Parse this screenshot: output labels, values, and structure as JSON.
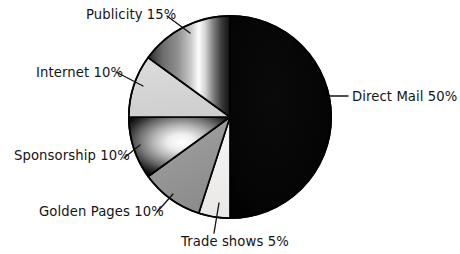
{
  "chart_data": {
    "type": "pie",
    "title": "",
    "subtitle": "",
    "xlabel": "",
    "ylabel": "",
    "legend_position": "callout-labels",
    "grid": false,
    "units": "percent",
    "total": 100,
    "categories": [
      "Direct Mail",
      "Trade shows",
      "Golden Pages",
      "Sponsorship",
      "Internet",
      "Publicity"
    ],
    "values": [
      50,
      5,
      10,
      10,
      10,
      15
    ],
    "slices": [
      {
        "name": "Direct Mail",
        "value": 50,
        "label": "Direct Mail 50%",
        "percent_text": "50%",
        "fill_style": "solid-black",
        "color": "#000000",
        "start_angle": 0,
        "end_angle": 180,
        "label_x": 352,
        "label_y": 101,
        "label_anchor": "start",
        "leader_from_x": 330,
        "leader_from_y": 96,
        "leader_to_x": 348,
        "leader_to_y": 96
      },
      {
        "name": "Trade shows",
        "value": 5,
        "label": "Trade shows 5%",
        "percent_text": "5%",
        "fill_style": "solid-near-white",
        "color": "#f0efee",
        "start_angle": 180,
        "end_angle": 198,
        "label_x": 181,
        "label_y": 246,
        "label_anchor": "start",
        "leader_from_x": 219,
        "leader_from_y": 203,
        "leader_to_x": 214,
        "leader_to_y": 233
      },
      {
        "name": "Golden Pages",
        "value": 10,
        "label": "Golden Pages 10%",
        "percent_text": "10%",
        "fill_style": "solid-mid-gray",
        "color": "#9a9a9a",
        "start_angle": 198,
        "end_angle": 234,
        "label_x": 39,
        "label_y": 216,
        "label_anchor": "start",
        "leader_from_x": 173,
        "leader_from_y": 194,
        "leader_to_x": 157,
        "leader_to_y": 212
      },
      {
        "name": "Sponsorship",
        "value": 10,
        "label": "Sponsorship 10%",
        "percent_text": "10%",
        "fill_style": "radial-highlight",
        "color": "#b4b4b4",
        "start_angle": 234,
        "end_angle": 270,
        "label_x": 14,
        "label_y": 160,
        "label_anchor": "start",
        "leader_from_x": 140,
        "leader_from_y": 145,
        "leader_to_x": 124,
        "leader_to_y": 158
      },
      {
        "name": "Internet",
        "value": 10,
        "label": "Internet 10%",
        "percent_text": "10%",
        "fill_style": "solid-light-gray",
        "color": "#d6d6d6",
        "start_angle": 270,
        "end_angle": 306,
        "label_x": 36,
        "label_y": 77,
        "label_anchor": "start",
        "leader_from_x": 143,
        "leader_from_y": 86,
        "leader_to_x": 116,
        "leader_to_y": 72
      },
      {
        "name": "Publicity",
        "value": 15,
        "label": "Publicity 15%",
        "percent_text": "15%",
        "fill_style": "vertical-gradient-highlight",
        "color": "#777777",
        "start_angle": 306,
        "end_angle": 360,
        "label_x": 86,
        "label_y": 19,
        "label_anchor": "start",
        "leader_from_x": 190,
        "leader_from_y": 33,
        "leader_to_x": 167,
        "leader_to_y": 16
      }
    ]
  },
  "colors": {
    "background": "#ffffff",
    "outline": "#000000",
    "text": "#141414",
    "direct_mail": "#000000",
    "trade_shows": "#f0efee",
    "golden_pages": "#9a9a9a",
    "sponsorship": "#b4b4b4",
    "internet": "#d6d6d6",
    "publicity": "#777777"
  }
}
